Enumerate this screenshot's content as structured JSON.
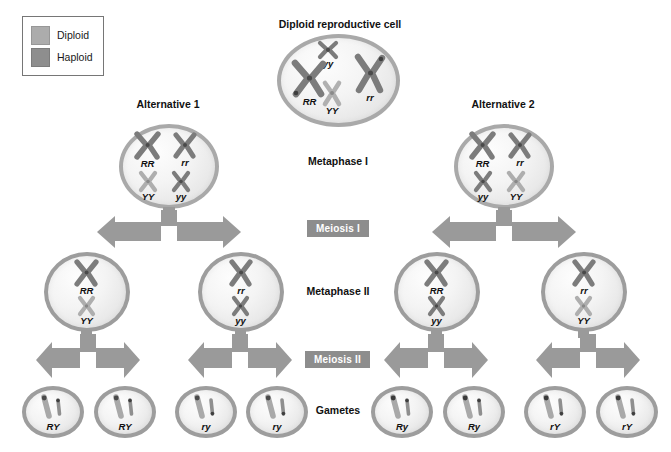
{
  "legend": {
    "title": "legend",
    "items": [
      {
        "label": "Diploid",
        "color": "#acacac"
      },
      {
        "label": "Haploid",
        "color": "#8e8e8e"
      }
    ]
  },
  "headings": {
    "source_cell": "Diploid reproductive cell",
    "alternative_1": "Alternative 1",
    "alternative_2": "Alternative 2"
  },
  "stage_labels": {
    "metaphase_1": "Metaphase I",
    "meiosis_1": "Meiosis I",
    "metaphase_2": "Metaphase II",
    "meiosis_2": "Meiosis II",
    "gametes": "Gametes"
  },
  "cells": {
    "parent": {
      "name": "Diploid reproductive cell",
      "chromosomes": [
        {
          "label": "yy",
          "size": "small",
          "shade": "dark"
        },
        {
          "label": "RR",
          "size": "large",
          "shade": "dark"
        },
        {
          "label": "rr",
          "size": "large",
          "shade": "dark"
        },
        {
          "label": "YY",
          "size": "small",
          "shade": "light"
        }
      ]
    },
    "metaphase1_alt1": {
      "chromosomes": [
        {
          "label": "RR",
          "size": "large",
          "shade": "dark"
        },
        {
          "label": "rr",
          "size": "large",
          "shade": "dark"
        },
        {
          "label": "YY",
          "size": "small",
          "shade": "light"
        },
        {
          "label": "yy",
          "size": "small",
          "shade": "dark"
        }
      ]
    },
    "metaphase1_alt2": {
      "chromosomes": [
        {
          "label": "RR",
          "size": "large",
          "shade": "dark"
        },
        {
          "label": "rr",
          "size": "large",
          "shade": "dark"
        },
        {
          "label": "yy",
          "size": "small",
          "shade": "dark"
        },
        {
          "label": "YY",
          "size": "small",
          "shade": "light"
        }
      ]
    },
    "metaphase2": [
      {
        "top": "RR",
        "bottom": "YY"
      },
      {
        "top": "rr",
        "bottom": "yy"
      },
      {
        "top": "RR",
        "bottom": "yy"
      },
      {
        "top": "rr",
        "bottom": "YY"
      }
    ],
    "gametes": [
      {
        "label": "RY"
      },
      {
        "label": "RY"
      },
      {
        "label": "ry"
      },
      {
        "label": "ry"
      },
      {
        "label": "Ry"
      },
      {
        "label": "Ry"
      },
      {
        "label": "rY"
      },
      {
        "label": "rY"
      }
    ]
  },
  "colors": {
    "chrom_dark": "#7e7e7e",
    "chrom_light": "#b4b4b4",
    "cell_border": "#a9a9a9",
    "arrow": "#9a9a9a",
    "badge_bg": "#8d8d8d",
    "text": "#111111"
  }
}
